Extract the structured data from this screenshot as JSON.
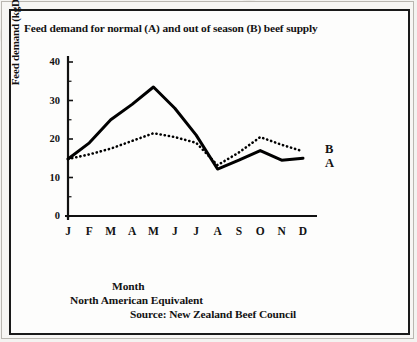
{
  "chart_data": {
    "type": "line",
    "title": "Feed demand for normal (A) and out of season (B) beef supply",
    "xlabel": "Month",
    "ylabel": "Feed demand (kgDM/d)",
    "categories": [
      "J",
      "F",
      "M",
      "A",
      "M",
      "J",
      "J",
      "A",
      "S",
      "O",
      "N",
      "D"
    ],
    "ylim": [
      0,
      40
    ],
    "yticks": [
      0,
      10,
      20,
      30,
      40
    ],
    "grid": false,
    "legend_position": "right-outside",
    "series": [
      {
        "name": "A",
        "label": "A",
        "style": "solid",
        "color": "#000000",
        "values": [
          14.8,
          19.0,
          25.0,
          29.0,
          33.5,
          28.0,
          21.0,
          12.2,
          14.5,
          17.0,
          14.5,
          15.0
        ]
      },
      {
        "name": "B",
        "label": "B",
        "style": "dotted",
        "color": "#000000",
        "values": [
          14.8,
          16.0,
          17.5,
          19.5,
          21.5,
          20.5,
          19.0,
          13.2,
          16.5,
          20.5,
          18.5,
          16.8
        ]
      }
    ],
    "annotations": [
      "North American Equivalent",
      "Source: New Zealand Beef Council"
    ]
  },
  "captions": {
    "month": "Month",
    "equivalent": "North American Equivalent",
    "source": "Source: New Zealand Beef Council"
  }
}
